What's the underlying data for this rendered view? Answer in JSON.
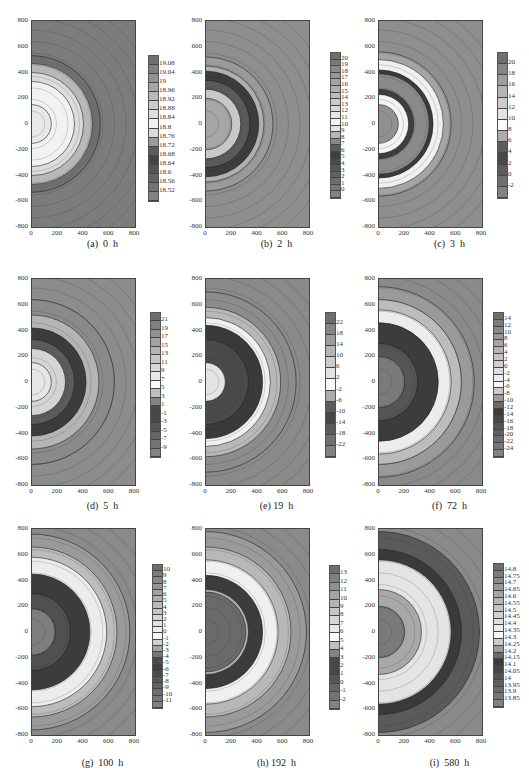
{
  "chart_data": [
    {
      "id": "a",
      "type": "heatmap",
      "title": "(a) 0 h",
      "caption": "(a)  0  h",
      "xticks": [
        "0",
        "200",
        "400",
        "600",
        "800"
      ],
      "yticks": [
        "800",
        "600",
        "400",
        "200",
        "0",
        "-200",
        "-400",
        "-600",
        "-800"
      ],
      "xlim": [
        0,
        800
      ],
      "ylim": [
        -800,
        800
      ],
      "colorbar": [
        "19.08",
        "19.04",
        "19",
        "18.96",
        "18.92",
        "18.88",
        "18.84",
        "18.8",
        "18.76",
        "18.72",
        "18.68",
        "18.64",
        "18.6",
        "18.56",
        "18.52"
      ],
      "rings": [
        {
          "r": 530,
          "shade": "#6e6e6e"
        },
        {
          "r": 470,
          "shade": "#b8b8b8"
        },
        {
          "r": 400,
          "shade": "#dcdcdc"
        },
        {
          "r": 330,
          "shade": "#f2f2f2"
        },
        {
          "r": 150,
          "shade": "#e8e8e8"
        }
      ],
      "background": "#7c7c7c"
    },
    {
      "id": "b",
      "type": "heatmap",
      "title": "(b) 2 h",
      "caption": "(b)  2  h",
      "xticks": [
        "0",
        "200",
        "400",
        "600",
        "800"
      ],
      "yticks": [
        "800",
        "600",
        "400",
        "200",
        "0",
        "-200",
        "-400",
        "-600",
        "-800"
      ],
      "xlim": [
        0,
        800
      ],
      "ylim": [
        -800,
        800
      ],
      "colorbar": [
        "20",
        "19",
        "18",
        "17",
        "16",
        "15",
        "14",
        "13",
        "12",
        "11",
        "10",
        "9",
        "8",
        "7",
        "6",
        "5",
        "4",
        "3",
        "2",
        "1",
        "0"
      ],
      "rings": [
        {
          "r": 520,
          "shade": "#9a9a9a"
        },
        {
          "r": 450,
          "shade": "#b0b0b0"
        },
        {
          "r": 410,
          "shade": "#3c3c3c"
        },
        {
          "r": 340,
          "shade": "#5a5a5a"
        },
        {
          "r": 270,
          "shade": "#c8c8c8"
        },
        {
          "r": 200,
          "shade": "#a6a6a6"
        }
      ],
      "background": "#8e8e8e"
    },
    {
      "id": "c",
      "type": "heatmap",
      "title": "(c) 3 h",
      "caption": "(c)  3  h",
      "xticks": [
        "0",
        "200",
        "400",
        "600",
        "800"
      ],
      "yticks": [
        "800",
        "600",
        "400",
        "200",
        "0",
        "-200",
        "-400",
        "-600",
        "-800"
      ],
      "xlim": [
        0,
        800
      ],
      "ylim": [
        -800,
        800
      ],
      "colorbar": [
        "20",
        "18",
        "16",
        "14",
        "12",
        "10",
        "8",
        "6",
        "4",
        "2",
        "0",
        "-2"
      ],
      "rings": [
        {
          "r": 560,
          "shade": "#a4a4a4"
        },
        {
          "r": 500,
          "shade": "#f0f0f0"
        },
        {
          "r": 420,
          "shade": "#3a3a3a"
        },
        {
          "r": 390,
          "shade": "#8a8a8a"
        },
        {
          "r": 270,
          "shade": "#3e3e3e"
        },
        {
          "r": 230,
          "shade": "#f4f4f4"
        },
        {
          "r": 150,
          "shade": "#909090"
        }
      ],
      "background": "#8e8e8e"
    },
    {
      "id": "d",
      "type": "heatmap",
      "title": "(d) 5 h",
      "caption": "(d)  5  h",
      "xticks": [
        "0",
        "200",
        "400",
        "600",
        "800"
      ],
      "yticks": [
        "800",
        "600",
        "400",
        "200",
        "0",
        "-200",
        "-400",
        "-600",
        "-800"
      ],
      "xlim": [
        0,
        800
      ],
      "ylim": [
        -800,
        800
      ],
      "colorbar": [
        "21",
        "19",
        "17",
        "15",
        "13",
        "11",
        "9",
        "7",
        "5",
        "3",
        "1",
        "-1",
        "-3",
        "-5",
        "-7",
        "-9"
      ],
      "rings": [
        {
          "r": 640,
          "shade": "#8a8a8a"
        },
        {
          "r": 520,
          "shade": "#b4b4b4"
        },
        {
          "r": 420,
          "shade": "#3c3c3c"
        },
        {
          "r": 330,
          "shade": "#5c5c5c"
        },
        {
          "r": 260,
          "shade": "#d4d4d4"
        },
        {
          "r": 150,
          "shade": "#e6e6e6"
        }
      ],
      "background": "#8c8c8c"
    },
    {
      "id": "e",
      "type": "heatmap",
      "title": "(e) 19 h",
      "caption": "(e) 19  h",
      "xticks": [
        "0",
        "200",
        "400",
        "600",
        "800"
      ],
      "yticks": [
        "800",
        "600",
        "400",
        "200",
        "0",
        "-200",
        "-400",
        "-600",
        "-800"
      ],
      "xlim": [
        0,
        800
      ],
      "ylim": [
        -800,
        800
      ],
      "colorbar": [
        "22",
        "18",
        "14",
        "10",
        "6",
        "2",
        "-2",
        "-6",
        "-10",
        "-14",
        "-18",
        "-22"
      ],
      "rings": [
        {
          "r": 700,
          "shade": "#8c8c8c"
        },
        {
          "r": 580,
          "shade": "#b8b8b8"
        },
        {
          "r": 500,
          "shade": "#f0f0f0"
        },
        {
          "r": 440,
          "shade": "#3a3a3a"
        },
        {
          "r": 330,
          "shade": "#4a4a4a"
        },
        {
          "r": 150,
          "shade": "#e4e4e4"
        }
      ],
      "background": "#8a8a8a"
    },
    {
      "id": "f",
      "type": "heatmap",
      "title": "(f) 72 h",
      "caption": "(f)  72  h",
      "xticks": [
        "0",
        "200",
        "400",
        "600",
        "800"
      ],
      "yticks": [
        "800",
        "600",
        "400",
        "200",
        "0",
        "-200",
        "-400",
        "-600",
        "-800"
      ],
      "xlim": [
        0,
        800
      ],
      "ylim": [
        -800,
        800
      ],
      "colorbar": [
        "14",
        "12",
        "10",
        "8",
        "6",
        "4",
        "2",
        "0",
        "-2",
        "-4",
        "-6",
        "-8",
        "-10",
        "-12",
        "-14",
        "-16",
        "-18",
        "-20",
        "-22",
        "-24"
      ],
      "rings": [
        {
          "r": 740,
          "shade": "#9a9a9a"
        },
        {
          "r": 640,
          "shade": "#bcbcbc"
        },
        {
          "r": 560,
          "shade": "#ececec"
        },
        {
          "r": 460,
          "shade": "#3c3c3c"
        },
        {
          "r": 300,
          "shade": "#555555"
        },
        {
          "r": 200,
          "shade": "#7a7a7a"
        }
      ],
      "background": "#8a8a8a"
    },
    {
      "id": "g",
      "type": "heatmap",
      "title": "(g) 100 h",
      "caption": "(g)  100  h",
      "xticks": [
        "0",
        "200",
        "400",
        "600",
        "800"
      ],
      "yticks": [
        "800",
        "600",
        "400",
        "200",
        "0",
        "-200",
        "-400",
        "-600",
        "-800"
      ],
      "xlim": [
        0,
        800
      ],
      "ylim": [
        -800,
        800
      ],
      "colorbar": [
        "10",
        "9",
        "8",
        "7",
        "6",
        "5",
        "4",
        "3",
        "2",
        "1",
        "0",
        "-1",
        "-2",
        "-3",
        "-4",
        "-5",
        "-6",
        "-7",
        "-8",
        "-9",
        "-10",
        "-11"
      ],
      "rings": [
        {
          "r": 760,
          "shade": "#9a9a9a"
        },
        {
          "r": 660,
          "shade": "#bcbcbc"
        },
        {
          "r": 580,
          "shade": "#ececec"
        },
        {
          "r": 450,
          "shade": "#3c3c3c"
        },
        {
          "r": 300,
          "shade": "#505050"
        },
        {
          "r": 180,
          "shade": "#7e7e7e"
        }
      ],
      "background": "#8a8a8a"
    },
    {
      "id": "h",
      "type": "heatmap",
      "title": "(h) 192 h",
      "caption": "(h) 192  h",
      "xticks": [
        "0",
        "200",
        "400",
        "600",
        "800"
      ],
      "yticks": [
        "800",
        "600",
        "400",
        "200",
        "0",
        "-200",
        "-400",
        "-600",
        "-800"
      ],
      "xlim": [
        0,
        800
      ],
      "ylim": [
        -800,
        800
      ],
      "colorbar": [
        "13",
        "12",
        "11",
        "10",
        "9",
        "8",
        "7",
        "6",
        "5",
        "4",
        "3",
        "2",
        "1",
        "0",
        "-1",
        "-2"
      ],
      "rings": [
        {
          "r": 780,
          "shade": "#9a9a9a"
        },
        {
          "r": 660,
          "shade": "#b8b8b8"
        },
        {
          "r": 560,
          "shade": "#f0f0f0"
        },
        {
          "r": 440,
          "shade": "#3c3c3c"
        },
        {
          "r": 330,
          "shade": "#b4b4b4"
        },
        {
          "r": 310,
          "shade": "#6a6a6a"
        }
      ],
      "background": "#8a8a8a"
    },
    {
      "id": "i",
      "type": "heatmap",
      "title": "(i) 580 h",
      "caption": "(i)  580  h",
      "xticks": [
        "0",
        "200",
        "400",
        "600",
        "800"
      ],
      "yticks": [
        "800",
        "600",
        "400",
        "200",
        "0",
        "-200",
        "-400",
        "-600",
        "-800"
      ],
      "xlim": [
        0,
        800
      ],
      "ylim": [
        -800,
        800
      ],
      "colorbar": [
        "14.8",
        "14.75",
        "14.7",
        "14.65",
        "14.6",
        "14.55",
        "14.5",
        "14.45",
        "14.4",
        "14.35",
        "14.3",
        "14.25",
        "14.2",
        "14.15",
        "14.1",
        "14.05",
        "14",
        "13.95",
        "13.9",
        "13.85"
      ],
      "rings": [
        {
          "r": 780,
          "shade": "#5a5a5a"
        },
        {
          "r": 640,
          "shade": "#3a3a3a"
        },
        {
          "r": 560,
          "shade": "#e4e4e4"
        },
        {
          "r": 330,
          "shade": "#a8a8a8"
        },
        {
          "r": 200,
          "shade": "#7a7a7a"
        }
      ],
      "background": "#8a8a8a"
    }
  ],
  "captions": {
    "a": "(a)  0  h",
    "b": "(b)  2  h",
    "c": "(c)  3  h",
    "d": "(d)  5  h",
    "e": "(e) 19  h",
    "f": "(f)  72  h",
    "g": "(g)  100  h",
    "h": "(h) 192  h",
    "i": "(i)  580  h"
  }
}
